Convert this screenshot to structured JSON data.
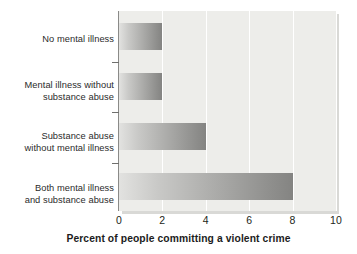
{
  "chart_data": {
    "type": "bar",
    "orientation": "horizontal",
    "title": "",
    "xlabel": "Percent of people committing a violent crime",
    "ylabel": "",
    "categories": [
      "No mental illness",
      "Mental illness without substance abuse",
      "Substance abuse without mental illness",
      "Both mental illness and substance abuse"
    ],
    "category_lines": [
      [
        "No mental illness"
      ],
      [
        "Mental illness without",
        "substance abuse"
      ],
      [
        "Substance abuse",
        "without mental illness"
      ],
      [
        "Both mental illness",
        "and substance abuse"
      ]
    ],
    "values": [
      2,
      2,
      4,
      8
    ],
    "xlim": [
      0,
      10
    ],
    "xticks": [
      0,
      2,
      4,
      6,
      8,
      10
    ],
    "xtick_labels": [
      "0",
      "2",
      "4",
      "6",
      "8",
      "10"
    ],
    "grid": true,
    "grid_color": "#ffffff",
    "legend": null,
    "plot_background": "#ededea",
    "bar_gradient_start": "#e2e2e0",
    "bar_gradient_end": "#848482",
    "axis_color": "#8a8a88"
  }
}
